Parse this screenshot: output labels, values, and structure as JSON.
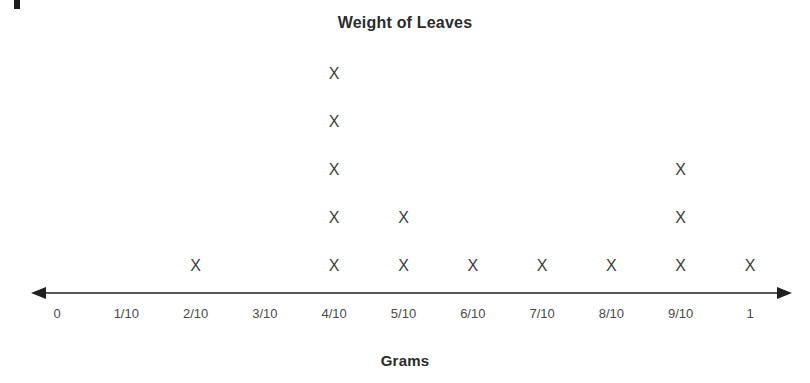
{
  "chart_data": {
    "type": "scatter",
    "plot_style": "dot-plot",
    "title": "Weight of Leaves",
    "xlabel": "Grams",
    "ylabel": "",
    "mark_glyph": "X",
    "categories": [
      "0",
      "1/10",
      "2/10",
      "3/10",
      "4/10",
      "5/10",
      "6/10",
      "7/10",
      "8/10",
      "9/10",
      "1"
    ],
    "x_values": [
      0,
      0.1,
      0.2,
      0.3,
      0.4,
      0.5,
      0.6,
      0.7,
      0.8,
      0.9,
      1
    ],
    "values": [
      0,
      0,
      1,
      0,
      5,
      2,
      1,
      1,
      1,
      3,
      1
    ],
    "counts_by_category": [
      {
        "label": "0",
        "count": 0
      },
      {
        "label": "1/10",
        "count": 0
      },
      {
        "label": "2/10",
        "count": 1
      },
      {
        "label": "3/10",
        "count": 0
      },
      {
        "label": "4/10",
        "count": 5
      },
      {
        "label": "5/10",
        "count": 2
      },
      {
        "label": "6/10",
        "count": 1
      },
      {
        "label": "7/10",
        "count": 1
      },
      {
        "label": "8/10",
        "count": 1
      },
      {
        "label": "9/10",
        "count": 3
      },
      {
        "label": "1",
        "count": 1
      }
    ],
    "total_marks": 15,
    "xlim": [
      0,
      1
    ],
    "ylim": [
      0,
      5
    ],
    "grid": false,
    "legend": false,
    "axis_style": "double-headed-arrow-number-line",
    "colors": {
      "mark": "#3d3d3d",
      "axis": "#555555",
      "text": "#2b2b2b",
      "background": "#ffffff"
    }
  },
  "layout": {
    "axis_y": 293,
    "axis_start_x": 33,
    "axis_end_x": 790,
    "first_tick_x": 57,
    "tick_spacing": 69.3,
    "row_base_y": 258,
    "row_spacing": 48
  }
}
